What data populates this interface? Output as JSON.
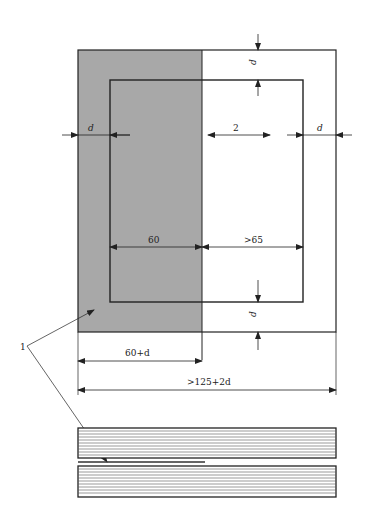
{
  "diagram": {
    "colors": {
      "fill": "#a8a8a8",
      "line": "#222222"
    },
    "labels": {
      "d_top": "d",
      "d_left": "d",
      "gap_2": "2",
      "d_right": "d",
      "width_60": "60",
      "width_gt65": ">65",
      "d_bottom": "d",
      "callout_1": "1",
      "width_60_plus_d": "60+d",
      "width_total": ">125+2d"
    }
  }
}
